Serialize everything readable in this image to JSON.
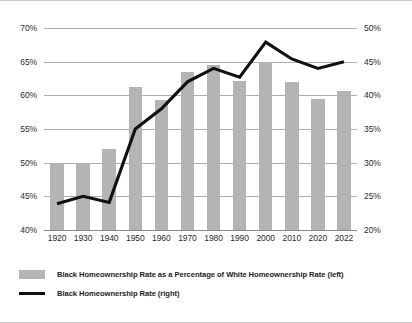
{
  "chart_data": {
    "type": "bar",
    "title": "",
    "subtitle": "",
    "xlabel": "",
    "categories": [
      "1920",
      "1930",
      "1940",
      "1950",
      "1960",
      "1970",
      "1980",
      "1990",
      "2000",
      "2010",
      "2020",
      "2022"
    ],
    "grid": true,
    "legend_position": "bottom-left",
    "axes": {
      "left": {
        "label": "",
        "ylim": [
          40,
          70
        ],
        "ticks": [
          40,
          45,
          50,
          55,
          60,
          65,
          70
        ],
        "tick_labels": [
          "40%",
          "45%",
          "50%",
          "55%",
          "60%",
          "65%",
          "70%"
        ]
      },
      "right": {
        "label": "",
        "ylim": [
          20,
          50
        ],
        "ticks": [
          20,
          25,
          30,
          35,
          40,
          45,
          50
        ],
        "tick_labels": [
          "20%",
          "25%",
          "30%",
          "35%",
          "40%",
          "45%",
          "50%"
        ]
      }
    },
    "series": [
      {
        "name": "Black Homeownership Rate as a Percentage of White Homeownership Rate (left)",
        "type": "bar",
        "axis": "left",
        "color": "#b4b4b4",
        "values": [
          50.0,
          50.0,
          52.1,
          61.3,
          59.3,
          63.5,
          64.5,
          62.2,
          65.0,
          62.0,
          59.4,
          60.7
        ]
      },
      {
        "name": "Black Homeownership Rate (right)",
        "type": "line",
        "axis": "right",
        "color": "#111111",
        "values": [
          23.9,
          25.0,
          24.1,
          35.0,
          38.0,
          42.0,
          44.0,
          42.7,
          47.9,
          45.4,
          44.0,
          45.0
        ]
      }
    ]
  },
  "legend": {
    "items": [
      {
        "marker": "bar-swatch",
        "label": "Black Homeownership Rate as a Percentage of White Homeownership Rate (left)"
      },
      {
        "marker": "line-swatch",
        "label": "Black Homeownership Rate (right)"
      }
    ]
  }
}
